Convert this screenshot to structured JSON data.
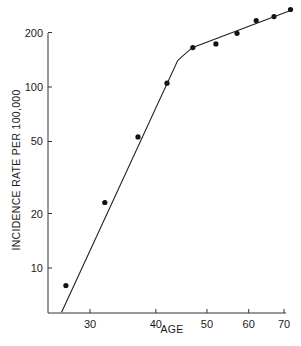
{
  "chart_data": {
    "type": "scatter",
    "title": "",
    "xlabel": "AGE",
    "ylabel": "INCIDENCE RATE PER 100,000",
    "xscale": "log",
    "yscale": "log",
    "xlim": [
      25,
      73
    ],
    "ylim": [
      5.5,
      270
    ],
    "x_ticks": [
      30,
      40,
      50,
      60,
      70
    ],
    "y_ticks": [
      10,
      20,
      50,
      100,
      200
    ],
    "grid": false,
    "legend": null,
    "series": [
      {
        "name": "observed",
        "kind": "points",
        "x": [
          27,
          32,
          37,
          42,
          47,
          52,
          57,
          62,
          67,
          72
        ],
        "y": [
          8,
          23,
          53,
          105,
          165,
          173,
          198,
          233,
          245,
          268
        ]
      },
      {
        "name": "fitted",
        "kind": "line",
        "x": [
          26.5,
          44,
          46,
          47,
          72
        ],
        "y": [
          5.7,
          140,
          158,
          165,
          265
        ]
      }
    ]
  },
  "axes": {
    "x_label": "AGE",
    "y_label": "INCIDENCE RATE PER 100,000",
    "x_tick_labels": [
      "30",
      "40",
      "50",
      "60",
      "70"
    ],
    "y_tick_labels": [
      "10",
      "20",
      "50",
      "100",
      "200"
    ]
  }
}
